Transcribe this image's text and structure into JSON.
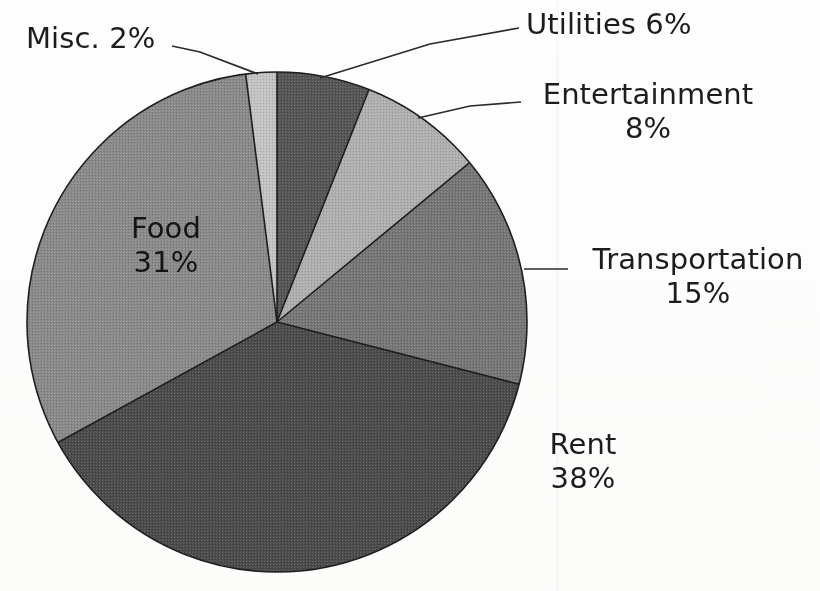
{
  "chart_data": {
    "type": "pie",
    "title": "",
    "subtitle": "",
    "xlabel": "",
    "ylabel": "",
    "legend_position": "none",
    "grid": false,
    "start_angle_deg": 0,
    "direction": "clockwise",
    "units": "percent",
    "categories": [
      "Utilities",
      "Entertainment",
      "Transportation",
      "Rent",
      "Food",
      "Misc."
    ],
    "values": [
      6,
      8,
      15,
      38,
      31,
      2
    ],
    "slices": [
      {
        "name": "Utilities",
        "label": "Utilities",
        "percent": 6,
        "percent_text": "6%",
        "label_text": "Utilities 6%",
        "color": "#545454",
        "label_placement": "outside",
        "leader_line": true
      },
      {
        "name": "Entertainment",
        "label": "Entertainment",
        "percent": 8,
        "percent_text": "8%",
        "label_text": "Entertainment 8%",
        "color": "#b0b0b0",
        "label_placement": "outside",
        "leader_line": true
      },
      {
        "name": "Transportation",
        "label": "Transportation",
        "percent": 15,
        "percent_text": "15%",
        "label_text": "Transportation 15%",
        "color": "#767676",
        "label_placement": "outside",
        "leader_line": true
      },
      {
        "name": "Rent",
        "label": "Rent",
        "percent": 38,
        "percent_text": "38%",
        "label_text": "Rent 38%",
        "color": "#4a4a4a",
        "label_placement": "outside",
        "leader_line": false
      },
      {
        "name": "Food",
        "label": "Food",
        "percent": 31,
        "percent_text": "31%",
        "label_text": "Food 31%",
        "color": "#8a8a8a",
        "label_placement": "inside",
        "leader_line": false
      },
      {
        "name": "Misc.",
        "label": "Misc.",
        "percent": 2,
        "percent_text": "2%",
        "label_text": "Misc. 2%",
        "color": "#c4c4c4",
        "label_placement": "outside",
        "leader_line": true
      }
    ]
  },
  "labels": {
    "misc": {
      "name": "Misc.",
      "percent": "2%",
      "combined": "Misc. 2%"
    },
    "utilities": {
      "name": "Utilities",
      "percent": "6%",
      "combined": "Utilities 6%"
    },
    "entertainment": {
      "name": "Entertainment",
      "percent": "8%"
    },
    "transportation": {
      "name": "Transportation",
      "percent": "15%"
    },
    "rent": {
      "name": "Rent",
      "percent": "38%"
    },
    "food": {
      "name": "Food",
      "percent": "31%"
    }
  },
  "colors": {
    "background": "#ffffff",
    "outline": "#1e1e1e",
    "text": "#1c1c1c",
    "utilities": "#545454",
    "entertainment": "#b0b0b0",
    "transportation": "#767676",
    "rent": "#4a4a4a",
    "food": "#8a8a8a",
    "misc": "#c4c4c4"
  },
  "geometry": {
    "center_x": 277,
    "center_y": 322,
    "radius": 250
  }
}
